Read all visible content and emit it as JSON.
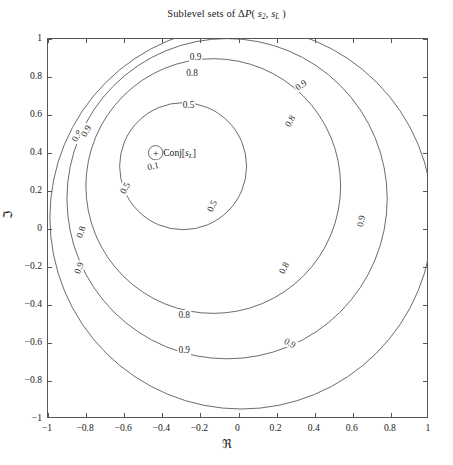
{
  "chart_data": {
    "type": "line",
    "title_parts": {
      "prefix": "Sublevel sets of ",
      "delta": "Δ",
      "func": "P",
      "open": "( ",
      "arg1": "s",
      "arg1_sub": "2",
      "comma": ", ",
      "arg2": "s",
      "arg2_sub": "L",
      "close": " )"
    },
    "xlabel": "ℜ",
    "ylabel": "ℑ",
    "xlim": [
      -1,
      1
    ],
    "ylim": [
      -1,
      1
    ],
    "grid": false,
    "legend": "none",
    "xticks": [
      "-1",
      "-0.8",
      "-0.6",
      "-0.4",
      "-0.2",
      "0",
      "0.2",
      "0.4",
      "0.6",
      "0.8",
      "1"
    ],
    "xtick_values": [
      -1,
      -0.8,
      -0.6,
      -0.4,
      -0.2,
      0,
      0.2,
      0.4,
      0.6,
      0.8,
      1
    ],
    "yticks": [
      "1",
      "0.8",
      "0.6",
      "0.4",
      "0.2",
      "0",
      "-0.2",
      "-0.4",
      "-0.6",
      "-0.8",
      "-1"
    ],
    "ytick_values": [
      1,
      0.8,
      0.6,
      0.4,
      0.2,
      0,
      -0.2,
      -0.4,
      -0.6,
      -0.8,
      -1
    ],
    "contour_levels": [
      0.1,
      0.5,
      0.8,
      0.9
    ],
    "contours": [
      {
        "level": "0.1",
        "cx": -0.432,
        "cy": 0.398,
        "r": 0.038
      },
      {
        "level": "0.5",
        "cx": -0.287,
        "cy": 0.327,
        "r": 0.335
      },
      {
        "level": "0.8",
        "cx": -0.128,
        "cy": 0.222,
        "r": 0.672
      },
      {
        "level": "0.9",
        "cx": -0.055,
        "cy": 0.155,
        "r": 0.845
      },
      {
        "level": "0.9",
        "cx": 0.02,
        "cy": 0.055,
        "r": 1.01
      }
    ],
    "contour_labels": [
      {
        "text": "0.1",
        "x": -0.448,
        "y": 0.332,
        "rot": -12
      },
      {
        "text": "0.5",
        "x": -0.262,
        "y": 0.655,
        "rot": 0
      },
      {
        "text": "0.5",
        "x": -0.598,
        "y": 0.215,
        "rot": -62
      },
      {
        "text": "0.5",
        "x": -0.14,
        "y": 0.122,
        "rot": -64
      },
      {
        "text": "0.8",
        "x": -0.244,
        "y": 0.822,
        "rot": 0
      },
      {
        "text": "0.8",
        "x": -0.85,
        "y": 0.488,
        "rot": -58
      },
      {
        "text": "0.8",
        "x": 0.27,
        "y": 0.568,
        "rot": -60
      },
      {
        "text": "0.8",
        "x": -0.825,
        "y": -0.018,
        "rot": -72
      },
      {
        "text": "0.8",
        "x": 0.24,
        "y": -0.205,
        "rot": -63
      },
      {
        "text": "0.8",
        "x": -0.285,
        "y": -0.45,
        "rot": 0
      },
      {
        "text": "0.9",
        "x": -0.225,
        "y": 0.905,
        "rot": 0
      },
      {
        "text": "0.9",
        "x": -0.802,
        "y": 0.518,
        "rot": -60
      },
      {
        "text": "0.9",
        "x": 0.33,
        "y": 0.76,
        "rot": -33
      },
      {
        "text": "0.9",
        "x": -0.838,
        "y": -0.205,
        "rot": -70
      },
      {
        "text": "0.9",
        "x": 0.645,
        "y": 0.042,
        "rot": -80
      },
      {
        "text": "0.9",
        "x": 0.268,
        "y": -0.598,
        "rot": 28
      },
      {
        "text": "0.9",
        "x": -0.285,
        "y": -0.635,
        "rot": 0
      }
    ],
    "marker": {
      "symbol": "+",
      "x": -0.432,
      "y": 0.398,
      "label": "Conj[s_L]",
      "label_parts": {
        "prefix": "Conj[",
        "var": "s",
        "sub": "L",
        "suffix": "]"
      }
    },
    "colors": {
      "contour": "#5a5a60",
      "axis": "#55555a",
      "text": "#1a1a1a",
      "background": "#ffffff"
    }
  }
}
